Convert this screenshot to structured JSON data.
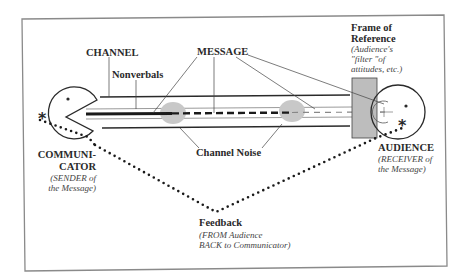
{
  "diagram": {
    "labels": {
      "channel": "CHANNEL",
      "nonverbals": "Nonverbals",
      "message": "MESSAGE",
      "frame_title_1": "Frame of",
      "frame_title_2": "Reference",
      "frame_sub_1": "(Audience's",
      "frame_sub_2": "\"filter \"of",
      "frame_sub_3": "attitudes, etc.)",
      "communicator_1": "COMMUNI-",
      "communicator_2": "CATOR",
      "communicator_sub_1": "(SENDER of",
      "communicator_sub_2": "the Message)",
      "channel_noise": "Channel Noise",
      "audience": "AUDIENCE",
      "audience_sub_1": "(RECEIVER of",
      "audience_sub_2": "the Message)",
      "feedback": "Feedback",
      "feedback_sub_1": "(FROM Audience",
      "feedback_sub_2": "BACK to Communicator)"
    },
    "colors": {
      "ink": "#2a2a2a",
      "noise": "#c8c8c8",
      "frame": "#bdbdbd",
      "border": "#8a8a8a"
    }
  }
}
